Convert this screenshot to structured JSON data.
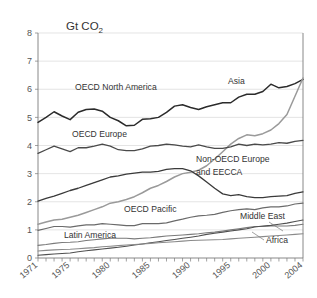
{
  "chart_data": {
    "type": "line",
    "title": "Gt CO2",
    "title_main": "Gt CO",
    "title_sub": "2",
    "xlabel": "",
    "ylabel": "",
    "xlim": [
      1971,
      2004
    ],
    "ylim": [
      0,
      8
    ],
    "grid": true,
    "legend_position": "inline-labels",
    "yticks": [
      "0",
      "1",
      "2",
      "3",
      "4",
      "5",
      "6",
      "7",
      "8"
    ],
    "xticks": [
      "1971",
      "1975",
      "1980",
      "1985",
      "1990",
      "1995",
      "2000",
      "2004"
    ],
    "x": [
      1971,
      1972,
      1973,
      1974,
      1975,
      1976,
      1977,
      1978,
      1979,
      1980,
      1981,
      1982,
      1983,
      1984,
      1985,
      1986,
      1987,
      1988,
      1989,
      1990,
      1991,
      1992,
      1993,
      1994,
      1995,
      1996,
      1997,
      1998,
      1999,
      2000,
      2001,
      2002,
      2003,
      2004
    ],
    "series": [
      {
        "name": "OECD North America",
        "color": "#2b2b2b",
        "width": 1.5,
        "label": "OECD North America",
        "label_x": 75,
        "label_y": 90,
        "values": [
          4.82,
          5.0,
          5.2,
          5.05,
          4.92,
          5.18,
          5.28,
          5.3,
          5.22,
          5.0,
          4.88,
          4.7,
          4.72,
          4.93,
          4.95,
          5.0,
          5.18,
          5.4,
          5.45,
          5.35,
          5.28,
          5.38,
          5.45,
          5.52,
          5.52,
          5.72,
          5.82,
          5.82,
          5.92,
          6.18,
          6.05,
          6.1,
          6.2,
          6.35
        ]
      },
      {
        "name": "Asia",
        "color": "#9a9a9a",
        "width": 1.5,
        "label": "Asia",
        "label_x": 228,
        "label_y": 84,
        "values": [
          1.2,
          1.28,
          1.35,
          1.38,
          1.45,
          1.52,
          1.62,
          1.72,
          1.82,
          1.95,
          2.0,
          2.08,
          2.18,
          2.32,
          2.48,
          2.58,
          2.72,
          2.88,
          3.0,
          3.05,
          3.12,
          3.28,
          3.52,
          3.78,
          4.05,
          4.25,
          4.38,
          4.35,
          4.42,
          4.55,
          4.78,
          5.1,
          5.75,
          6.4
        ]
      },
      {
        "name": "OECD Europe",
        "color": "#4a4a4a",
        "width": 1.3,
        "label": "OECD Europe",
        "label_x": 72,
        "label_y": 137,
        "values": [
          3.72,
          3.85,
          3.98,
          3.88,
          3.78,
          3.92,
          3.92,
          3.98,
          4.05,
          3.98,
          3.85,
          3.82,
          3.82,
          3.88,
          3.98,
          4.0,
          4.05,
          4.02,
          3.98,
          3.95,
          4.02,
          3.95,
          3.9,
          3.9,
          3.95,
          4.05,
          4.0,
          4.05,
          4.02,
          4.05,
          4.1,
          4.08,
          4.15,
          4.18
        ]
      },
      {
        "name": "Non-OECD Europe and EECCA",
        "color": "#3a3a3a",
        "width": 1.3,
        "label": "Non-OECD Europe",
        "label2": "and EECCA",
        "label_x": 196,
        "label_y": 162,
        "label2_y": 175,
        "values": [
          2.02,
          2.12,
          2.2,
          2.3,
          2.4,
          2.48,
          2.58,
          2.68,
          2.78,
          2.88,
          2.92,
          2.98,
          3.02,
          3.05,
          3.05,
          3.08,
          3.15,
          3.18,
          3.18,
          3.1,
          2.92,
          2.7,
          2.48,
          2.28,
          2.22,
          2.25,
          2.18,
          2.15,
          2.15,
          2.18,
          2.2,
          2.22,
          2.3,
          2.35
        ]
      },
      {
        "name": "OECD Pacific",
        "color": "#6a6a6a",
        "width": 1.2,
        "label": "OECD Pacific",
        "label_x": 124,
        "label_y": 212,
        "values": [
          0.98,
          1.05,
          1.12,
          1.12,
          1.1,
          1.14,
          1.18,
          1.18,
          1.22,
          1.2,
          1.18,
          1.15,
          1.15,
          1.22,
          1.22,
          1.22,
          1.25,
          1.32,
          1.38,
          1.45,
          1.5,
          1.52,
          1.55,
          1.62,
          1.68,
          1.72,
          1.75,
          1.72,
          1.78,
          1.82,
          1.82,
          1.85,
          1.92,
          1.95
        ]
      },
      {
        "name": "Latin America",
        "color": "#7a7a7a",
        "width": 1.1,
        "label": "Latin America",
        "label_x": 64,
        "label_y": 238,
        "values": [
          0.45,
          0.48,
          0.52,
          0.55,
          0.56,
          0.58,
          0.62,
          0.65,
          0.68,
          0.7,
          0.7,
          0.7,
          0.68,
          0.7,
          0.72,
          0.75,
          0.78,
          0.8,
          0.82,
          0.84,
          0.86,
          0.9,
          0.92,
          0.96,
          1.0,
          1.04,
          1.08,
          1.12,
          1.12,
          1.14,
          1.14,
          1.14,
          1.16,
          1.2
        ]
      },
      {
        "name": "Middle East",
        "color": "#505050",
        "width": 1.1,
        "label": "Middle East",
        "label_x": 240,
        "label_y": 219,
        "values": [
          0.1,
          0.12,
          0.14,
          0.16,
          0.18,
          0.22,
          0.26,
          0.29,
          0.32,
          0.35,
          0.38,
          0.42,
          0.46,
          0.5,
          0.54,
          0.58,
          0.62,
          0.66,
          0.7,
          0.74,
          0.78,
          0.84,
          0.88,
          0.92,
          0.96,
          1.0,
          1.04,
          1.1,
          1.14,
          1.16,
          1.2,
          1.24,
          1.3,
          1.35
        ]
      },
      {
        "name": "Africa",
        "color": "#8a8a8a",
        "width": 1.1,
        "label": "Africa",
        "label_x": 266,
        "label_y": 243,
        "values": [
          0.25,
          0.27,
          0.29,
          0.3,
          0.31,
          0.33,
          0.35,
          0.37,
          0.4,
          0.42,
          0.44,
          0.46,
          0.48,
          0.5,
          0.52,
          0.54,
          0.56,
          0.58,
          0.6,
          0.62,
          0.63,
          0.64,
          0.65,
          0.66,
          0.68,
          0.7,
          0.72,
          0.74,
          0.76,
          0.78,
          0.8,
          0.82,
          0.84,
          0.86
        ]
      }
    ]
  }
}
